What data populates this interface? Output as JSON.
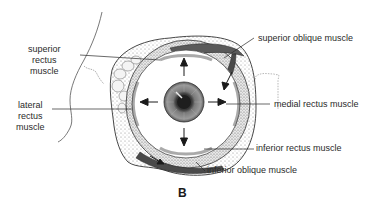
{
  "figure": {
    "panel_label": "B",
    "labels": {
      "superior_rectus": [
        "superior",
        "rectus",
        "muscle"
      ],
      "lateral_rectus": [
        "lateral",
        "rectus",
        "muscle"
      ],
      "superior_oblique": "superior oblique muscle",
      "medial_rectus": "medial rectus muscle",
      "inferior_rectus": "inferior rectus muscle",
      "inferior_oblique": "inferior oblique muscle"
    },
    "arrows": [
      "up",
      "down",
      "left",
      "right"
    ],
    "colors": {
      "ink": "#2a2a2a",
      "stipple": "#9a9a9a",
      "iris": "#6e6e6e",
      "pupil": "#1e1e1e",
      "background": "#ffffff"
    }
  }
}
